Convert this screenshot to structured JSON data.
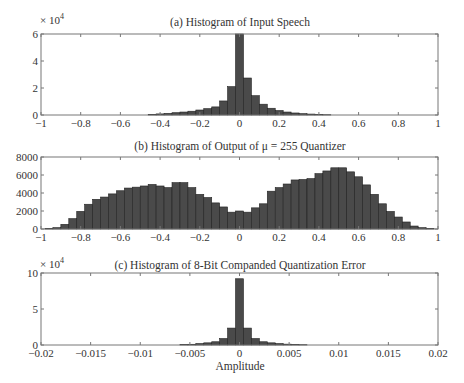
{
  "chart_data": [
    {
      "type": "bar",
      "title": "(a) Histogram of Input Speech",
      "xlabel": "",
      "ylabel": "",
      "y_multiplier": "× 10",
      "y_multiplier_exp": "4",
      "xlim": [
        -1,
        1
      ],
      "ylim": [
        0,
        6
      ],
      "xticks": [
        -1,
        -0.8,
        -0.6,
        -0.4,
        -0.2,
        0,
        0.2,
        0.4,
        0.6,
        0.8,
        1
      ],
      "xtick_labels": [
        "−1",
        "−0.8",
        "−0.6",
        "−0.4",
        "−0.2",
        "0",
        "0.2",
        "0.4",
        "0.6",
        "0.8",
        "1"
      ],
      "yticks": [
        0,
        2,
        4,
        6
      ],
      "ytick_labels": [
        "0",
        "2",
        "4",
        "6"
      ],
      "bin_width": 0.04,
      "x": [
        -0.44,
        -0.4,
        -0.36,
        -0.32,
        -0.28,
        -0.24,
        -0.2,
        -0.16,
        -0.12,
        -0.08,
        -0.04,
        0.0,
        0.04,
        0.08,
        0.12,
        0.16,
        0.2,
        0.24,
        0.28,
        0.32,
        0.36,
        0.4,
        0.44
      ],
      "values": [
        0.05,
        0.08,
        0.12,
        0.17,
        0.22,
        0.28,
        0.37,
        0.47,
        0.6,
        1.04,
        2.1,
        6.0,
        2.74,
        1.43,
        0.8,
        0.5,
        0.33,
        0.22,
        0.15,
        0.1,
        0.07,
        0.04,
        0.02
      ]
    },
    {
      "type": "bar",
      "title": "(b) Histogram of Output of μ = 255 Quantizer",
      "xlabel": "",
      "ylabel": "",
      "xlim": [
        -1,
        1
      ],
      "ylim": [
        0,
        8000
      ],
      "xticks": [
        -1,
        -0.8,
        -0.6,
        -0.4,
        -0.2,
        0,
        0.2,
        0.4,
        0.6,
        0.8,
        1
      ],
      "xtick_labels": [
        "−1",
        "−0.8",
        "−0.6",
        "−0.4",
        "−0.2",
        "0",
        "0.2",
        "0.4",
        "0.6",
        "0.8",
        "1"
      ],
      "yticks": [
        0,
        2000,
        4000,
        6000,
        8000
      ],
      "ytick_labels": [
        "0",
        "2000",
        "4000",
        "6000",
        "8000"
      ],
      "bin_width": 0.04,
      "x": [
        -0.96,
        -0.92,
        -0.88,
        -0.84,
        -0.8,
        -0.76,
        -0.72,
        -0.68,
        -0.64,
        -0.6,
        -0.56,
        -0.52,
        -0.48,
        -0.44,
        -0.4,
        -0.36,
        -0.32,
        -0.28,
        -0.24,
        -0.2,
        -0.16,
        -0.12,
        -0.08,
        -0.04,
        0.0,
        0.04,
        0.08,
        0.12,
        0.16,
        0.2,
        0.24,
        0.28,
        0.32,
        0.36,
        0.4,
        0.44,
        0.48,
        0.52,
        0.56,
        0.6,
        0.64,
        0.68,
        0.72,
        0.76,
        0.8,
        0.84,
        0.88,
        0.92,
        0.96
      ],
      "values": [
        50,
        150,
        520,
        1150,
        1960,
        2750,
        3300,
        3550,
        3900,
        4250,
        4550,
        4650,
        4780,
        4950,
        4780,
        4600,
        5150,
        5150,
        4600,
        3850,
        3500,
        2900,
        2450,
        1870,
        2000,
        1870,
        2350,
        2800,
        4200,
        4600,
        5000,
        5450,
        5500,
        5600,
        6150,
        6450,
        6800,
        6800,
        6350,
        5800,
        4900,
        3850,
        2800,
        1950,
        1330,
        780,
        330,
        150,
        40
      ]
    },
    {
      "type": "bar",
      "title": "(c) Histogram of 8-Bit Companded Quantization Error",
      "xlabel": "Amplitude",
      "ylabel": "",
      "y_multiplier": "× 10",
      "y_multiplier_exp": "4",
      "xlim": [
        -0.02,
        0.02
      ],
      "ylim": [
        0,
        10
      ],
      "xticks": [
        -0.02,
        -0.015,
        -0.01,
        -0.005,
        0,
        0.005,
        0.01,
        0.015,
        0.02
      ],
      "xtick_labels": [
        "−0.02",
        "−0.015",
        "−0.01",
        "−0.005",
        "0",
        "0.005",
        "0.01",
        "0.015",
        "0.02"
      ],
      "yticks": [
        0,
        5,
        10
      ],
      "ytick_labels": [
        "0",
        "5",
        "10"
      ],
      "bin_width": 0.0008,
      "x": [
        -0.0056,
        -0.0048,
        -0.004,
        -0.0032,
        -0.0024,
        -0.0016,
        -0.0008,
        0.0,
        0.0008,
        0.0016,
        0.0024,
        0.0032,
        0.004,
        0.0048,
        0.0056,
        0.0064
      ],
      "values": [
        0.05,
        0.1,
        0.2,
        0.3,
        0.45,
        0.9,
        2.35,
        9.2,
        2.35,
        0.9,
        0.45,
        0.3,
        0.2,
        0.12,
        0.07,
        0.04
      ]
    }
  ]
}
